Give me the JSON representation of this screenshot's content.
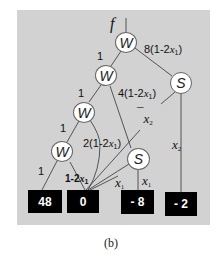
{
  "caption": "(b)",
  "root_label": "f",
  "nodes": [
    {
      "id": "w1",
      "type": "W",
      "label": "W",
      "cx": 126,
      "cy": 42
    },
    {
      "id": "w2",
      "type": "W",
      "label": "W",
      "cx": 106,
      "cy": 76
    },
    {
      "id": "w3",
      "type": "W",
      "label": "W",
      "cx": 84,
      "cy": 112
    },
    {
      "id": "w4",
      "type": "W",
      "label": "W",
      "cx": 62,
      "cy": 152
    },
    {
      "id": "s1",
      "type": "S",
      "label": "S",
      "cx": 181,
      "cy": 83
    },
    {
      "id": "s2",
      "type": "S",
      "label": "S",
      "cx": 138,
      "cy": 159
    }
  ],
  "leaves": [
    {
      "id": "t48",
      "value": "48",
      "x": 28,
      "y": 190,
      "w": 34,
      "h": 23
    },
    {
      "id": "t0",
      "value": "0",
      "x": 67,
      "y": 190,
      "w": 32,
      "h": 23
    },
    {
      "id": "tm8",
      "value": "- 8",
      "x": 121,
      "y": 190,
      "w": 33,
      "h": 24
    },
    {
      "id": "tm2",
      "value": "- 2",
      "x": 165,
      "y": 192,
      "w": 32,
      "h": 24
    }
  ],
  "edge_labels": {
    "w1_w2": "1",
    "w1_s1": "8(1-2x1)",
    "w2_w3": "1",
    "w2_t0": "4(1-2x1)",
    "w3_w4": "1",
    "w3_t0": "2(1-2x1)",
    "w4_t48": "1",
    "w4_t0": "1-2x1",
    "s1_t0": "x2",
    "s1_tm2": "x2",
    "s2_t0": "x1",
    "s2_tm8": "x1"
  },
  "label_parts": {
    "eight": "8(1-2",
    "four": "4(1-2",
    "two": "2(1-2",
    "one": "1-2",
    "x": "x",
    "sub1": "1",
    "sub2": "2",
    "close": ")",
    "bar": "¯"
  }
}
